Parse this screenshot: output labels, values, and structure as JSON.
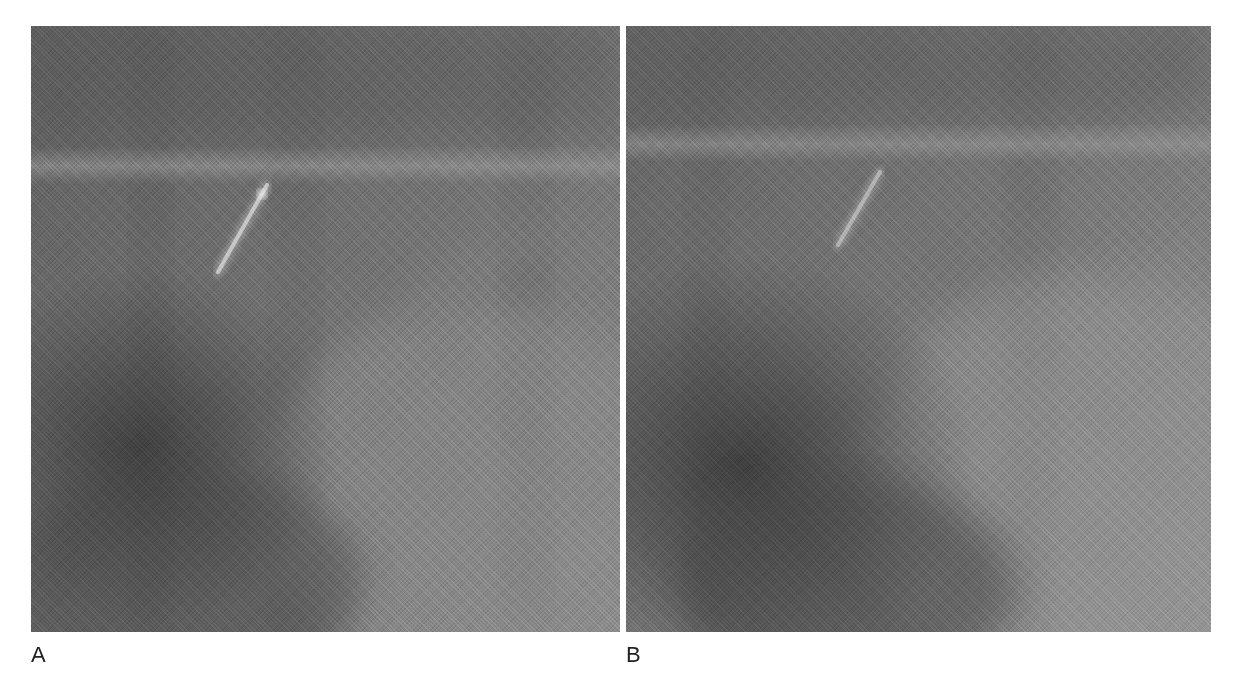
{
  "figure": {
    "panels": [
      {
        "id": "A",
        "label": "A",
        "base_color": "#6f6f6f",
        "streak": {
          "x1": 236,
          "y1": 159,
          "x2": 187,
          "y2": 246,
          "color": "#d8d8d8"
        },
        "horizontal_band_y": 140,
        "dark_region": {
          "cx": 110,
          "cy": 420,
          "rx": 200,
          "ry": 180
        }
      },
      {
        "id": "B",
        "label": "B",
        "base_color": "#747474",
        "streak": {
          "x1": 254,
          "y1": 146,
          "x2": 212,
          "y2": 219,
          "color": "#c8c8c8"
        },
        "horizontal_band_y": 118,
        "dark_region": {
          "cx": 120,
          "cy": 440,
          "rx": 230,
          "ry": 210
        }
      }
    ]
  }
}
